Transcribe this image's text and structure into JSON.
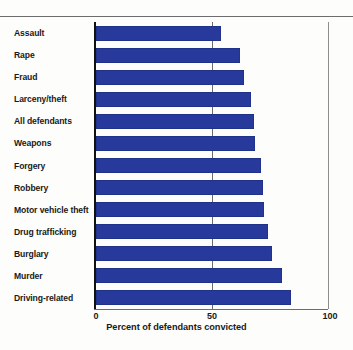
{
  "chart_data": {
    "type": "bar",
    "orientation": "horizontal",
    "title": "",
    "xlabel": "Percent of defendants convicted",
    "ylabel": "",
    "xlim": [
      0,
      100
    ],
    "xticks": [
      "0",
      "50",
      "100"
    ],
    "grid": true,
    "legend": false,
    "bar_color": "#27399b",
    "categories": [
      "Assault",
      "Rape",
      "Fraud",
      "Larceny/theft",
      "All defendants",
      "Weapons",
      "Forgery",
      "Robbery",
      "Motor vehicle theft",
      "Drug trafficking",
      "Burglary",
      "Murder",
      "Driving-related"
    ],
    "values": [
      54,
      62,
      64,
      67,
      68,
      68.5,
      71,
      72,
      72.5,
      74,
      76,
      80,
      84
    ]
  },
  "axis": {
    "tick_0": "0",
    "tick_50": "50",
    "tick_100": "100",
    "x_axis_title": "Percent of defendants convicted"
  }
}
